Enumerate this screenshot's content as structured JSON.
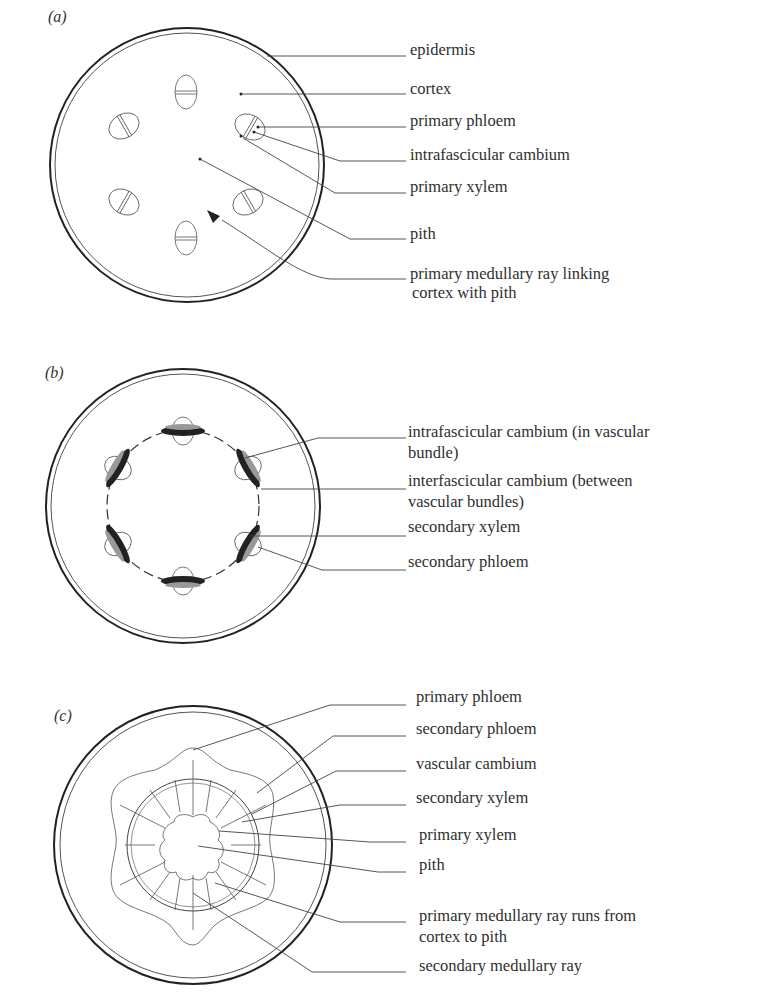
{
  "figure": {
    "panels": [
      {
        "id": "a",
        "label": "(a)",
        "labels": [
          {
            "text": "epidermis"
          },
          {
            "text": "cortex"
          },
          {
            "text": "primary phloem"
          },
          {
            "text": "intrafascicular cambium"
          },
          {
            "text": "primary xylem"
          },
          {
            "text": "pith"
          },
          {
            "text": "primary medullary ray linking",
            "text2": "cortex with pith"
          }
        ]
      },
      {
        "id": "b",
        "label": "(b)",
        "labels": [
          {
            "text": "intrafascicular cambium (in vascular",
            "text2": "bundle)"
          },
          {
            "text": "interfascicular cambium (between",
            "text2": "vascular bundles)"
          },
          {
            "text": "secondary xylem"
          },
          {
            "text": "secondary phloem"
          }
        ]
      },
      {
        "id": "c",
        "label": "(c)",
        "labels": [
          {
            "text": "primary phloem"
          },
          {
            "text": "secondary phloem"
          },
          {
            "text": "vascular cambium"
          },
          {
            "text": "secondary xylem"
          },
          {
            "text": "primary xylem"
          },
          {
            "text": "pith"
          },
          {
            "text": "primary medullary ray runs from",
            "text2": "cortex to pith"
          },
          {
            "text": "secondary medullary ray"
          }
        ]
      }
    ]
  }
}
